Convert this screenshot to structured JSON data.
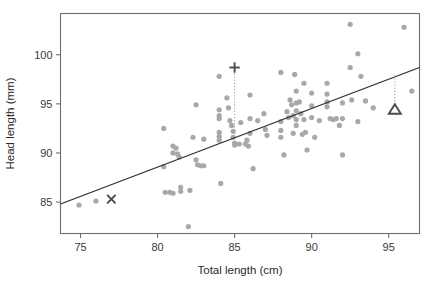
{
  "figure": {
    "name": "possum-head-length-vs-total-length-scatter",
    "background": "#ffffff"
  },
  "chart_data": {
    "type": "scatter",
    "title": "",
    "xlabel": "Total length (cm)",
    "ylabel": "Head length (mm)",
    "xlim": [
      73.7,
      97.0
    ],
    "ylim": [
      81.8,
      104.2
    ],
    "xticks": [
      75,
      80,
      85,
      90,
      95
    ],
    "xtick_labels": [
      "75",
      "80",
      "85",
      "90",
      "95"
    ],
    "yticks": [
      85,
      90,
      95,
      100
    ],
    "ytick_labels": [
      "85",
      "90",
      "95",
      "100"
    ],
    "grid": false,
    "legend": "none",
    "point_color": "#a8a8a8",
    "line_color": "#2d2d2d",
    "marker_color": "#4a4a4a",
    "points": [
      [
        74.9,
        84.7
      ],
      [
        76.0,
        85.1
      ],
      [
        80.4,
        92.5
      ],
      [
        80.4,
        88.6
      ],
      [
        80.5,
        86.0
      ],
      [
        80.8,
        86.0
      ],
      [
        81.0,
        90.0
      ],
      [
        81.0,
        90.7
      ],
      [
        81.0,
        85.9
      ],
      [
        81.2,
        90.5
      ],
      [
        81.3,
        89.9
      ],
      [
        81.4,
        89.6
      ],
      [
        81.5,
        86.5
      ],
      [
        81.5,
        86.1
      ],
      [
        82.0,
        82.5
      ],
      [
        82.1,
        86.2
      ],
      [
        82.3,
        91.6
      ],
      [
        82.5,
        94.9
      ],
      [
        82.5,
        89.3
      ],
      [
        82.6,
        88.8
      ],
      [
        82.8,
        88.7
      ],
      [
        83.0,
        88.7
      ],
      [
        83.0,
        91.4
      ],
      [
        84.0,
        97.8
      ],
      [
        84.0,
        94.4
      ],
      [
        84.0,
        93.8
      ],
      [
        84.0,
        93.5
      ],
      [
        84.0,
        92.1
      ],
      [
        84.0,
        91.7
      ],
      [
        84.0,
        91.3
      ],
      [
        84.1,
        86.9
      ],
      [
        84.5,
        95.6
      ],
      [
        84.6,
        94.6
      ],
      [
        84.7,
        93.3
      ],
      [
        84.8,
        92.8
      ],
      [
        84.9,
        92.2
      ],
      [
        84.9,
        91.6
      ],
      [
        85.0,
        91.0
      ],
      [
        85.0,
        90.8
      ],
      [
        85.3,
        90.9
      ],
      [
        85.4,
        93.1
      ],
      [
        85.7,
        90.9
      ],
      [
        85.8,
        91.3
      ],
      [
        85.9,
        90.7
      ],
      [
        86.0,
        95.9
      ],
      [
        86.0,
        93.5
      ],
      [
        86.0,
        92.0
      ],
      [
        86.2,
        88.4
      ],
      [
        86.5,
        93.3
      ],
      [
        86.9,
        94.0
      ],
      [
        87.0,
        92.4
      ],
      [
        87.1,
        91.8
      ],
      [
        88.0,
        98.2
      ],
      [
        88.0,
        93.2
      ],
      [
        88.0,
        92.3
      ],
      [
        88.0,
        91.6
      ],
      [
        88.2,
        89.8
      ],
      [
        88.4,
        94.2
      ],
      [
        88.5,
        93.6
      ],
      [
        88.6,
        95.4
      ],
      [
        88.7,
        94.9
      ],
      [
        88.8,
        93.8
      ],
      [
        88.8,
        92.0
      ],
      [
        88.9,
        98.0
      ],
      [
        89.0,
        96.3
      ],
      [
        89.0,
        95.1
      ],
      [
        89.0,
        94.3
      ],
      [
        89.0,
        93.4
      ],
      [
        89.0,
        92.8
      ],
      [
        89.2,
        95.2
      ],
      [
        89.3,
        94.0
      ],
      [
        89.4,
        91.9
      ],
      [
        89.5,
        97.1
      ],
      [
        89.5,
        93.4
      ],
      [
        89.6,
        92.1
      ],
      [
        89.7,
        90.3
      ],
      [
        90.0,
        96.1
      ],
      [
        90.0,
        94.8
      ],
      [
        90.0,
        93.6
      ],
      [
        90.2,
        91.6
      ],
      [
        90.5,
        93.3
      ],
      [
        91.0,
        97.1
      ],
      [
        91.0,
        96.0
      ],
      [
        91.0,
        95.2
      ],
      [
        91.0,
        94.7
      ],
      [
        91.2,
        93.5
      ],
      [
        91.4,
        93.4
      ],
      [
        91.6,
        93.5
      ],
      [
        91.8,
        92.8
      ],
      [
        92.0,
        95.1
      ],
      [
        92.0,
        93.5
      ],
      [
        92.0,
        89.8
      ],
      [
        92.5,
        103.1
      ],
      [
        92.5,
        98.7
      ],
      [
        92.6,
        95.4
      ],
      [
        93.0,
        100.1
      ],
      [
        93.0,
        93.2
      ],
      [
        93.2,
        97.8
      ],
      [
        93.5,
        95.3
      ],
      [
        94.0,
        94.6
      ],
      [
        96.0,
        102.8
      ],
      [
        96.5,
        96.3
      ]
    ],
    "regression_line": {
      "label": "least-squares-fit",
      "x_start": 73.7,
      "y_start": 84.8,
      "x_end": 97.0,
      "y_end": 98.7
    },
    "annotated_markers": [
      {
        "name": "x-marker-observed-low",
        "glyph": "X",
        "x": 77.0,
        "y": 85.3,
        "leader": null
      },
      {
        "name": "plus-marker-positive-residual",
        "glyph": "+",
        "x": 85.0,
        "y": 98.7,
        "leader": {
          "x": 85.0,
          "y_top": 98.4,
          "y_bottom": 91.4
        }
      },
      {
        "name": "triangle-marker-negative-residual",
        "glyph": "triangle",
        "x": 95.4,
        "y": 94.4,
        "leader": {
          "x": 95.4,
          "y_top": 97.9,
          "y_bottom": 95.0
        }
      }
    ]
  }
}
